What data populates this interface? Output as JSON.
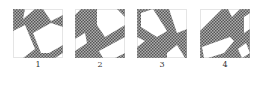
{
  "figure": {
    "panels": [
      {
        "label": "1",
        "pattern": "hatched-crossing-bands"
      },
      {
        "label": "2",
        "pattern": "hatched-crossing-bands"
      },
      {
        "label": "3",
        "pattern": "hatched-crossing-bands"
      },
      {
        "label": "4",
        "pattern": "hatched-crossing-bands"
      }
    ],
    "colors": {
      "band": "#8c8c8c",
      "hatch": "#555555",
      "background": "#ffffff",
      "border": "#999999"
    }
  }
}
